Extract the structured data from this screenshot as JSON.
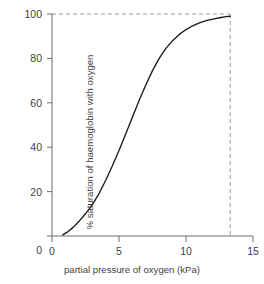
{
  "chart_data": {
    "type": "line",
    "title": "",
    "subtitle": "",
    "xlabel": "partial pressure of oxygen (kPa)",
    "ylabel": "% saturation of haemoglobin with oxygen",
    "xlim": [
      0,
      15
    ],
    "ylim": [
      0,
      100
    ],
    "xticks": [
      "0",
      "5",
      "10",
      "15"
    ],
    "xtick_values": [
      0,
      5,
      10,
      15
    ],
    "yticks": [
      "0",
      "20",
      "40",
      "60",
      "80",
      "100"
    ],
    "ytick_values": [
      0,
      20,
      40,
      60,
      80,
      100
    ],
    "grid": false,
    "legend": null,
    "legend_position": "none",
    "series": [
      {
        "name": "oxygen dissociation curve",
        "color": "#1a1a1a",
        "x": [
          0.8,
          1.2,
          1.6,
          2.0,
          2.5,
          3.0,
          3.5,
          4.0,
          4.5,
          5.0,
          5.5,
          6.0,
          6.5,
          7.0,
          7.5,
          8.0,
          8.5,
          9.0,
          9.5,
          10.0,
          10.5,
          11.0,
          11.5,
          12.0,
          12.5,
          13.0,
          13.3
        ],
        "y": [
          0.5,
          2.0,
          4.0,
          6.5,
          10.0,
          14.0,
          19.0,
          25.0,
          31.5,
          38.5,
          46.0,
          53.5,
          61.0,
          68.0,
          74.5,
          80.0,
          84.5,
          88.0,
          90.8,
          93.0,
          94.7,
          96.0,
          97.0,
          97.7,
          98.3,
          98.8,
          99.0
        ]
      }
    ],
    "annotations": [
      {
        "name": "saturation-reference-line",
        "type": "hline",
        "value": 100,
        "style": "dashed",
        "color": "#9a9a9a",
        "from_x": 0,
        "to_x": 13.3
      },
      {
        "name": "arterial-pressure-reference-line",
        "type": "vline",
        "value": 13.3,
        "style": "dashed",
        "color": "#9a9a9a",
        "from_y": 0,
        "to_y": 100
      }
    ]
  },
  "axes": {
    "line_color": "#6e6e6e",
    "curve_color": "#1a1a1a",
    "dash_color": "#9a9a9a"
  }
}
